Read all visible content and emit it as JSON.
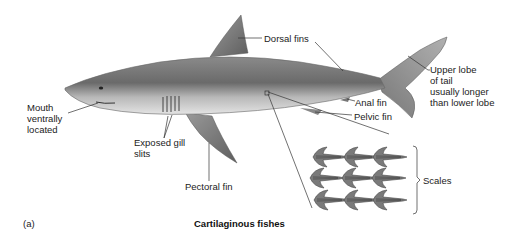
{
  "figure": {
    "panel_label": "(a)",
    "caption": "Cartilaginous fishes"
  },
  "labels": {
    "dorsal_fins": "Dorsal fins",
    "upper_lobe": "Upper lobe\nof tail\nusually longer\nthan lower lobe",
    "anal_fin": "Anal fin",
    "pelvic_fin": "Pelvic fin",
    "mouth": "Mouth\nventrally\nlocated",
    "gill_slits": "Exposed gill\nslits",
    "pectoral_fin": "Pectoral fin",
    "scales": "Scales"
  },
  "colors": {
    "body_dark": "#6e6e6e",
    "body_light": "#c9c9c9",
    "belly": "#e6e6e6",
    "line": "#333333",
    "text": "#222222"
  }
}
